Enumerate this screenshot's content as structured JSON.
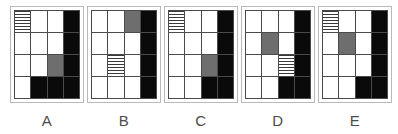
{
  "diagram": {
    "type": "matrix-reasoning-answer-options",
    "grid_rows": 4,
    "grid_columns": 4,
    "colors": {
      "black": "#0a0a0a",
      "gray": "#6e6e6e",
      "white": "#ffffff",
      "stripe_line": "#3a3a3a",
      "grid_line": "#4a4a4a",
      "panel_border": "#b9b9b9",
      "label_text": "#4c4c4c"
    },
    "fill_legend": {
      "white": "empty cell",
      "black": "solid black cell",
      "gray": "solid gray cell",
      "striped": "horizontally striped cell"
    },
    "options": [
      {
        "label": "A",
        "cells": [
          [
            "striped",
            "white",
            "white",
            "black"
          ],
          [
            "white",
            "white",
            "white",
            "black"
          ],
          [
            "white",
            "white",
            "gray",
            "black"
          ],
          [
            "white",
            "black",
            "black",
            "black"
          ]
        ]
      },
      {
        "label": "B",
        "cells": [
          [
            "white",
            "white",
            "gray",
            "black"
          ],
          [
            "white",
            "white",
            "white",
            "black"
          ],
          [
            "white",
            "striped",
            "white",
            "black"
          ],
          [
            "white",
            "white",
            "white",
            "black"
          ]
        ]
      },
      {
        "label": "C",
        "cells": [
          [
            "striped",
            "white",
            "white",
            "black"
          ],
          [
            "white",
            "white",
            "white",
            "black"
          ],
          [
            "white",
            "white",
            "gray",
            "black"
          ],
          [
            "white",
            "white",
            "black",
            "black"
          ]
        ]
      },
      {
        "label": "D",
        "cells": [
          [
            "white",
            "white",
            "white",
            "black"
          ],
          [
            "white",
            "gray",
            "white",
            "black"
          ],
          [
            "white",
            "white",
            "striped",
            "black"
          ],
          [
            "white",
            "white",
            "black",
            "black"
          ]
        ]
      },
      {
        "label": "E",
        "cells": [
          [
            "striped",
            "white",
            "white",
            "black"
          ],
          [
            "white",
            "gray",
            "white",
            "black"
          ],
          [
            "white",
            "white",
            "white",
            "black"
          ],
          [
            "white",
            "white",
            "black",
            "black"
          ]
        ]
      }
    ]
  }
}
